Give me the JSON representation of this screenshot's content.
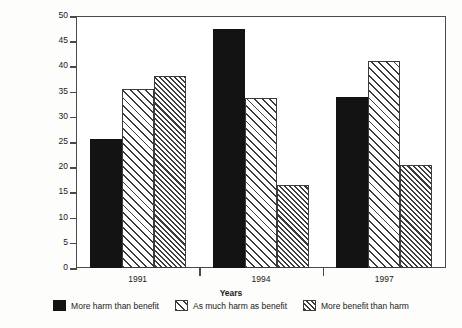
{
  "chart_data": {
    "type": "bar",
    "title": "",
    "xlabel": "Years",
    "ylabel": "Per cent",
    "categories": [
      "1991",
      "1994",
      "1997"
    ],
    "series": [
      {
        "name": "More harm than benefit",
        "values": [
          25.5,
          47.5,
          34.0
        ],
        "fill": "solid-black",
        "color": "#131313"
      },
      {
        "name": "As much harm as benefit",
        "values": [
          35.5,
          33.8,
          41.0
        ],
        "fill": "hatch-sparse",
        "color": "#3c3c3c"
      },
      {
        "name": "More benefit than harm",
        "values": [
          38.0,
          16.4,
          20.4
        ],
        "fill": "hatch-dense",
        "color": "#3c3c3c"
      }
    ],
    "ylim": [
      0,
      50
    ],
    "ytick_step": 5,
    "yticks": [
      "0",
      "5",
      "10",
      "15",
      "20",
      "25",
      "30",
      "35",
      "40",
      "45",
      "50"
    ],
    "grid": false,
    "legend_position": "bottom",
    "frame": true
  },
  "axes": {
    "y_title": "Per cent",
    "x_title": "Years"
  },
  "legend": {
    "items": [
      {
        "label": "More harm than benefit"
      },
      {
        "label": "As much harm as benefit"
      },
      {
        "label": "More benefit than harm"
      }
    ]
  }
}
